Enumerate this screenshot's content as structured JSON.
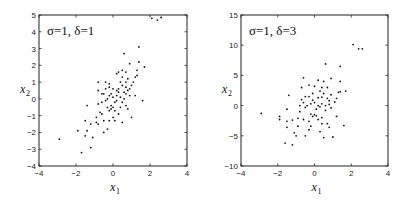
{
  "chart_data": [
    {
      "type": "scatter",
      "title": "σ=1, δ=1",
      "xlabel": "x1",
      "ylabel": "x2",
      "xlim": [
        -4,
        4
      ],
      "ylim": [
        -4,
        5
      ],
      "xticks": [
        -4,
        -2,
        0,
        2,
        4
      ],
      "yticks": [
        -4,
        -3,
        -2,
        -1,
        0,
        1,
        2,
        3,
        4,
        5
      ],
      "grid": false,
      "legend": null,
      "points": [
        [
          -2.9,
          -2.4
        ],
        [
          -1.7,
          -3.2
        ],
        [
          -1.2,
          -2.9
        ],
        [
          -1.5,
          -2.2
        ],
        [
          -1.1,
          -2.3
        ],
        [
          -1.9,
          -1.9
        ],
        [
          -1.4,
          -1.9
        ],
        [
          -1.2,
          -1.5
        ],
        [
          -1.5,
          -1.3
        ],
        [
          -1.4,
          -0.4
        ],
        [
          -0.9,
          -1.1
        ],
        [
          -0.8,
          -1.5
        ],
        [
          -0.5,
          -2.0
        ],
        [
          -0.3,
          -1.8
        ],
        [
          -0.2,
          -1.3
        ],
        [
          -0.7,
          -0.8
        ],
        [
          -0.8,
          -0.3
        ],
        [
          -0.6,
          -0.2
        ],
        [
          -0.4,
          -0.1
        ],
        [
          -0.3,
          -0.5
        ],
        [
          -0.1,
          -0.6
        ],
        [
          -0.2,
          -0.7
        ],
        [
          0.0,
          -0.5
        ],
        [
          0.1,
          -0.7
        ],
        [
          0.1,
          -1.3
        ],
        [
          0.3,
          -0.9
        ],
        [
          0.5,
          -1.4
        ],
        [
          0.4,
          -0.5
        ],
        [
          0.7,
          -0.4
        ],
        [
          0.8,
          -0.6
        ],
        [
          1.0,
          -1.1
        ],
        [
          -0.5,
          0.3
        ],
        [
          -0.3,
          0.0
        ],
        [
          -0.1,
          0.3
        ],
        [
          0.0,
          0.1
        ],
        [
          0.2,
          -0.1
        ],
        [
          0.3,
          0.4
        ],
        [
          0.4,
          0.1
        ],
        [
          0.6,
          0.0
        ],
        [
          0.7,
          0.3
        ],
        [
          0.9,
          0.2
        ],
        [
          1.2,
          0.2
        ],
        [
          1.6,
          -0.1
        ],
        [
          -0.8,
          0.5
        ],
        [
          -0.6,
          0.3
        ],
        [
          -0.4,
          0.6
        ],
        [
          -0.2,
          0.7
        ],
        [
          0.0,
          0.6
        ],
        [
          0.2,
          0.5
        ],
        [
          0.3,
          0.6
        ],
        [
          0.5,
          0.8
        ],
        [
          0.7,
          0.7
        ],
        [
          0.8,
          0.5
        ],
        [
          1.0,
          0.8
        ],
        [
          -0.8,
          1.0
        ],
        [
          -0.4,
          1.0
        ],
        [
          -0.2,
          0.9
        ],
        [
          0.2,
          1.5
        ],
        [
          0.4,
          1.0
        ],
        [
          0.5,
          1.3
        ],
        [
          0.7,
          1.0
        ],
        [
          0.8,
          1.2
        ],
        [
          1.1,
          1.0
        ],
        [
          1.2,
          1.3
        ],
        [
          0.3,
          1.6
        ],
        [
          0.5,
          1.7
        ],
        [
          0.7,
          1.6
        ],
        [
          0.9,
          2.1
        ],
        [
          1.3,
          1.7
        ],
        [
          1.4,
          2.2
        ],
        [
          1.7,
          1.9
        ],
        [
          0.6,
          2.7
        ],
        [
          1.4,
          3.1
        ],
        [
          2.1,
          4.8
        ],
        [
          2.4,
          4.7
        ],
        [
          2.6,
          4.85
        ],
        [
          -0.6,
          -0.9
        ],
        [
          0.1,
          -0.2
        ],
        [
          -0.1,
          -0.4
        ],
        [
          0.5,
          -0.2
        ],
        [
          0.9,
          0.6
        ],
        [
          -0.5,
          -1.3
        ],
        [
          -0.9,
          -1.4
        ],
        [
          0.0,
          -1.1
        ],
        [
          1.3,
          1.4
        ],
        [
          0.6,
          0.4
        ],
        [
          0.2,
          0.2
        ],
        [
          -0.2,
          0.2
        ]
      ]
    },
    {
      "type": "scatter",
      "title": "σ=1, δ=3",
      "xlabel": "x1",
      "ylabel": "x2",
      "xlim": [
        -4,
        4
      ],
      "ylim": [
        -10,
        15
      ],
      "xticks": [
        -4,
        -2,
        0,
        2,
        4
      ],
      "yticks": [
        -10,
        -5,
        0,
        5,
        10,
        15
      ],
      "grid": false,
      "legend": null,
      "points": [
        [
          -2.9,
          -1.3
        ],
        [
          -1.9,
          -1.8
        ],
        [
          -1.9,
          -2.3
        ],
        [
          -1.6,
          -6.2
        ],
        [
          -1.2,
          -6.5
        ],
        [
          -1.5,
          -3.6
        ],
        [
          -1.5,
          -2.6
        ],
        [
          -1.2,
          -2.4
        ],
        [
          -1.1,
          -4.5
        ],
        [
          -1.0,
          -5.0
        ],
        [
          -1.4,
          1.7
        ],
        [
          -1.5,
          -0.6
        ],
        [
          -0.9,
          -2.1
        ],
        [
          -0.8,
          -1.0
        ],
        [
          -0.6,
          -2.3
        ],
        [
          -0.5,
          -5.0
        ],
        [
          -0.3,
          -4.0
        ],
        [
          -0.2,
          -3.4
        ],
        [
          -0.1,
          -1.8
        ],
        [
          0.0,
          -1.5
        ],
        [
          0.1,
          -1.7
        ],
        [
          0.2,
          -2.3
        ],
        [
          0.3,
          -4.3
        ],
        [
          0.4,
          -3.0
        ],
        [
          0.5,
          -5.3
        ],
        [
          0.7,
          -3.0
        ],
        [
          0.8,
          -3.6
        ],
        [
          1.0,
          -5.2
        ],
        [
          1.2,
          -1.8
        ],
        [
          1.6,
          -3.3
        ],
        [
          -0.8,
          0.0
        ],
        [
          -0.6,
          0.5
        ],
        [
          -0.4,
          0.0
        ],
        [
          -0.2,
          0.3
        ],
        [
          0.0,
          0.5
        ],
        [
          0.2,
          0.0
        ],
        [
          0.4,
          0.3
        ],
        [
          0.6,
          0.0
        ],
        [
          0.8,
          0.2
        ],
        [
          -0.7,
          1.0
        ],
        [
          -0.5,
          1.5
        ],
        [
          -0.3,
          1.5
        ],
        [
          -0.1,
          2.0
        ],
        [
          0.2,
          1.3
        ],
        [
          0.4,
          1.4
        ],
        [
          0.5,
          2.0
        ],
        [
          0.7,
          1.2
        ],
        [
          0.9,
          1.8
        ],
        [
          1.2,
          1.2
        ],
        [
          1.3,
          2.2
        ],
        [
          1.4,
          4.0
        ],
        [
          -0.7,
          3.0
        ],
        [
          -0.6,
          4.6
        ],
        [
          -0.3,
          3.4
        ],
        [
          0.0,
          3.2
        ],
        [
          0.2,
          4.2
        ],
        [
          0.4,
          3.0
        ],
        [
          0.5,
          4.0
        ],
        [
          0.7,
          3.0
        ],
        [
          0.9,
          4.5
        ],
        [
          1.4,
          2.3
        ],
        [
          1.7,
          2.4
        ],
        [
          0.6,
          6.9
        ],
        [
          1.4,
          6.5
        ],
        [
          2.1,
          10.1
        ],
        [
          2.4,
          9.4
        ],
        [
          2.6,
          9.4
        ],
        [
          -0.5,
          -0.3
        ],
        [
          0.1,
          -0.6
        ],
        [
          -0.2,
          -1.4
        ],
        [
          0.3,
          -0.2
        ],
        [
          0.9,
          -0.4
        ],
        [
          -0.9,
          -3.4
        ],
        [
          0.6,
          -0.8
        ],
        [
          -0.3,
          -2.6
        ],
        [
          0.4,
          -2.0
        ],
        [
          1.1,
          0.6
        ],
        [
          -0.1,
          0.9
        ],
        [
          0.3,
          2.4
        ],
        [
          0.8,
          0.8
        ]
      ]
    }
  ],
  "panels": [
    {
      "annotation": "σ=1, δ=1",
      "xlabel": "x",
      "xlabel_sub": "1",
      "ylabel": "x",
      "ylabel_sub": "2"
    },
    {
      "annotation": "σ=1, δ=3",
      "xlabel": "x",
      "xlabel_sub": "1",
      "ylabel": "x",
      "ylabel_sub": "2"
    }
  ]
}
